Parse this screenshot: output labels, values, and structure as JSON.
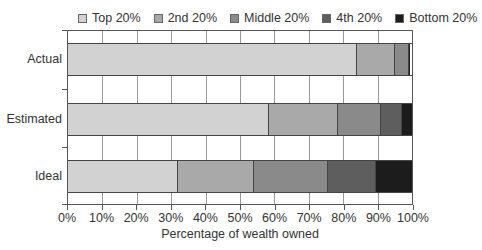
{
  "chart_data": {
    "type": "bar",
    "orientation": "horizontal",
    "stacked": true,
    "title": "",
    "xlabel": "Percentage of wealth owned",
    "ylabel": "",
    "xlim": [
      0,
      100
    ],
    "x_ticks": [
      "0%",
      "10%",
      "20%",
      "30%",
      "40%",
      "50%",
      "60%",
      "70%",
      "80%",
      "90%",
      "100%"
    ],
    "categories": [
      "Actual",
      "Estimated",
      "Ideal"
    ],
    "series": [
      {
        "name": "Top 20%",
        "color": "#d2d2d2",
        "values": [
          84.0,
          58.5,
          32.0
        ]
      },
      {
        "name": "2nd 20%",
        "color": "#a9a9a9",
        "values": [
          11.0,
          20.0,
          22.0
        ]
      },
      {
        "name": "Middle 20%",
        "color": "#8a8a8a",
        "values": [
          4.0,
          12.5,
          21.5
        ]
      },
      {
        "name": "4th 20%",
        "color": "#5e5e5e",
        "values": [
          0.2,
          6.0,
          14.0
        ]
      },
      {
        "name": "Bottom 20%",
        "color": "#1c1c1c",
        "values": [
          0.1,
          3.0,
          10.5
        ]
      }
    ],
    "grid": {
      "vertical": true,
      "horizontal": false
    },
    "legend_position": "top"
  }
}
